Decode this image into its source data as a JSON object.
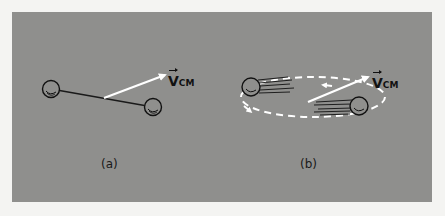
{
  "figure": {
    "background_color": "#8f8f8d",
    "page_color": "#f4f4f2",
    "panels": [
      {
        "id": "a",
        "caption": "(a)",
        "vector_label": {
          "symbol": "V",
          "subscript": "CM"
        },
        "description": "Two balls joined by a rod; white arrow from the midpoint shows center-of-mass velocity"
      },
      {
        "id": "b",
        "caption": "(b)",
        "vector_label": {
          "symbol": "V",
          "subscript": "CM"
        },
        "description": "Two balls orbiting on a dashed white elliptical path with motion streaks; white arrow shows center-of-mass velocity"
      }
    ]
  }
}
